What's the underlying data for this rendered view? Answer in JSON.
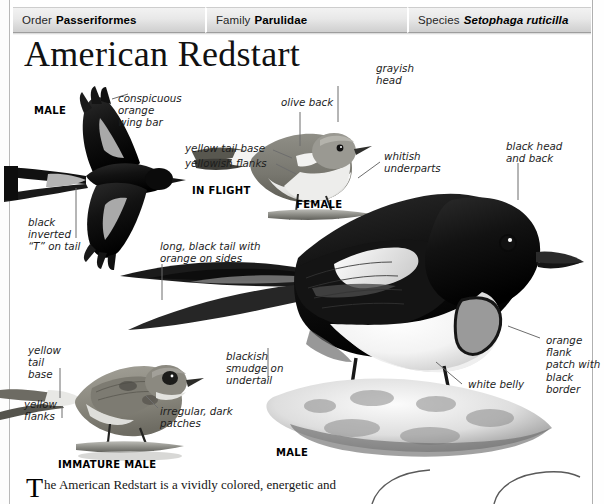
{
  "taxonomy": {
    "order": {
      "key": "Order",
      "value": "Passeriformes"
    },
    "family": {
      "key": "Family",
      "value": "Parulidae"
    },
    "species": {
      "key": "Species",
      "value": "Setophaga ruticilla"
    }
  },
  "title": "American Redstart",
  "captions": {
    "male_flight": "MALE",
    "in_flight": "IN FLIGHT",
    "female": "FEMALE",
    "male_perched": "MALE",
    "immature_male": "IMMATURE MALE"
  },
  "annotations": {
    "wing_bar": "conspicuous\norange\nwing bar",
    "inverted_t": "black\ninverted\n“T” on tail",
    "olive_back": "olive back",
    "grayish_head": "grayish\nhead",
    "yellow_tail_base_female": "yellow tail base",
    "yellowish_flanks": "yellowish flanks",
    "whitish_underparts": "whitish\nunderparts",
    "black_head_back": "black head\nand back",
    "long_black_tail": "long, black tail with\norange on sides",
    "blackish_smudge": "blackish\nsmudge on\nundertail",
    "orange_flank_patch": "orange flank\npatch with\nblack border",
    "white_belly": "white belly",
    "yellow_tail_base_immature": "yellow\ntail\nbase",
    "yellow_flanks": "yellow\nflanks",
    "irregular_patches": "irregular, dark\npatches"
  },
  "body_text": {
    "dropcap": "T",
    "text": "he American Redstart is a vividly colored, energetic and"
  },
  "colors": {
    "bar_light": "#f2f2f2",
    "bar_dark": "#cfcfcf",
    "rule": "#b9b9b9",
    "ink": "#1b1b1b",
    "leader": "#6d6d6d"
  }
}
